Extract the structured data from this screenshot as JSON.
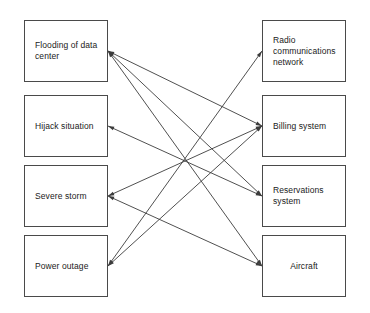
{
  "diagram": {
    "type": "bipartite-mapping",
    "title": "",
    "background_color": "#ffffff",
    "box_border_color": "#4a4a4a",
    "edge_color": "#3c3c3c",
    "left_column": {
      "heading": "",
      "nodes": [
        {
          "id": "flooding",
          "label": "Flooding of data\ncenter",
          "align": "left",
          "x": 24,
          "y": 20,
          "w": 84,
          "h": 62,
          "anchor_x": 108,
          "anchor_y": 51
        },
        {
          "id": "hijack",
          "label": "Hijack situation",
          "align": "left",
          "x": 24,
          "y": 95,
          "w": 84,
          "h": 62,
          "anchor_x": 108,
          "anchor_y": 126
        },
        {
          "id": "storm",
          "label": "Severe storm",
          "align": "left",
          "x": 24,
          "y": 165,
          "w": 84,
          "h": 62,
          "anchor_x": 108,
          "anchor_y": 196
        },
        {
          "id": "outage",
          "label": "Power outage",
          "align": "left",
          "x": 24,
          "y": 235,
          "w": 84,
          "h": 62,
          "anchor_x": 108,
          "anchor_y": 266
        }
      ]
    },
    "right_column": {
      "heading": "",
      "nodes": [
        {
          "id": "radio",
          "label": "Radio\ncommunications\nnetwork",
          "align": "left",
          "x": 262,
          "y": 20,
          "w": 84,
          "h": 62,
          "anchor_x": 262,
          "anchor_y": 51
        },
        {
          "id": "billing",
          "label": "Billing system",
          "align": "left",
          "x": 262,
          "y": 95,
          "w": 84,
          "h": 62,
          "anchor_x": 262,
          "anchor_y": 126
        },
        {
          "id": "reservations",
          "label": "Reservations\nsystem",
          "align": "left",
          "x": 262,
          "y": 165,
          "w": 84,
          "h": 62,
          "anchor_x": 262,
          "anchor_y": 196
        },
        {
          "id": "aircraft",
          "label": "Aircraft",
          "align": "center",
          "x": 262,
          "y": 235,
          "w": 84,
          "h": 62,
          "anchor_x": 262,
          "anchor_y": 266
        }
      ]
    },
    "edges": [
      {
        "from": "flooding",
        "to": "billing",
        "arrow": "both"
      },
      {
        "from": "flooding",
        "to": "reservations",
        "arrow": "both"
      },
      {
        "from": "flooding",
        "to": "aircraft",
        "arrow": "both"
      },
      {
        "from": "hijack",
        "to": "reservations",
        "arrow": "both"
      },
      {
        "from": "storm",
        "to": "billing",
        "arrow": "both"
      },
      {
        "from": "storm",
        "to": "aircraft",
        "arrow": "both"
      },
      {
        "from": "outage",
        "to": "radio",
        "arrow": "both"
      },
      {
        "from": "outage",
        "to": "billing",
        "arrow": "both"
      }
    ]
  }
}
